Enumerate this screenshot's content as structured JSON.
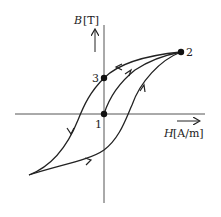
{
  "diagram": {
    "type": "hysteresis-loop",
    "y_axis": {
      "symbol": "B",
      "unit": "[T]"
    },
    "x_axis": {
      "symbol": "H",
      "unit": "[A/m]"
    },
    "points": [
      {
        "id": "1",
        "label": "1",
        "description": "origin"
      },
      {
        "id": "2",
        "label": "2",
        "description": "saturation point"
      },
      {
        "id": "3",
        "label": "3",
        "description": "residual magnetism on B axis"
      }
    ],
    "colors": {
      "line": "#222222",
      "axis": "#555555",
      "background": "#ffffff"
    }
  }
}
